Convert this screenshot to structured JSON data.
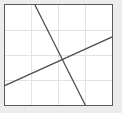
{
  "figure": {
    "background_color": "#ececed",
    "plot_background_color": "#ffffff",
    "frame_color": "#5a5a5a",
    "grid_color": "#e3e3e6",
    "line_color": "#4d4d52"
  },
  "chart_data": {
    "type": "line",
    "title": "",
    "subtitle": "",
    "xlabel": "",
    "ylabel": "",
    "xlim": [
      0,
      4
    ],
    "ylim": [
      0,
      4
    ],
    "xticks": [
      0,
      1,
      2,
      3,
      4
    ],
    "yticks": [
      0,
      1,
      2,
      3,
      4
    ],
    "xticklabels": [
      "",
      "",
      "",
      "",
      ""
    ],
    "yticklabels": [
      "",
      "",
      "",
      "",
      ""
    ],
    "grid": true,
    "grid_axis": "both",
    "legend": false,
    "legend_position": "none",
    "annotations": [],
    "series": [
      {
        "name": "descending-line",
        "type": "line",
        "x": [
          1.12,
          3.0
        ],
        "y": [
          4.0,
          0.0
        ],
        "slope": -2.128,
        "intercept": 6.383,
        "color": "#4d4d52"
      },
      {
        "name": "ascending-line",
        "type": "line",
        "x": [
          0.0,
          4.0
        ],
        "y": [
          0.78,
          2.72
        ],
        "slope": 0.485,
        "intercept": 0.78,
        "color": "#4d4d52"
      }
    ],
    "intersection": {
      "x": 2.09,
      "y": 1.79
    }
  }
}
